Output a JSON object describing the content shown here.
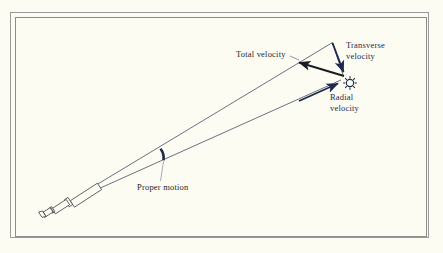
{
  "figure": {
    "background_color": "#fdfcf3",
    "frame_color": "#9a9a9a",
    "ink_color": "#1d2a4d",
    "dark_ink_color": "#23252b"
  },
  "labels": {
    "total_velocity": "Total velocity",
    "transverse_velocity_line1": "Transverse",
    "transverse_velocity_line2": "velocity",
    "radial_velocity_line1": "Radial",
    "radial_velocity_line2": "velocity",
    "proper_motion": "Proper motion"
  },
  "objects": {
    "telescope": "telescope-icon",
    "star": "star-icon",
    "angle_marker": "proper-motion-angle-arc"
  },
  "vectors": [
    {
      "name": "total-velocity",
      "label": "Total velocity",
      "style": "thick-arrow",
      "from": [
        343,
        75
      ],
      "to": [
        295,
        61
      ],
      "color": "#191c24"
    },
    {
      "name": "transverse-velocity",
      "label": "Transverse velocity",
      "style": "thick-arrow",
      "from": [
        332,
        42
      ],
      "to": [
        344,
        73
      ],
      "color": "#1d2a4d"
    },
    {
      "name": "radial-velocity",
      "label": "Radial velocity",
      "style": "thick-arrow",
      "from": [
        300,
        101
      ],
      "to": [
        340,
        83
      ],
      "color": "#1d2a4d"
    },
    {
      "name": "triangle-hypotenuse",
      "label": "",
      "style": "thin-line",
      "from": [
        332,
        42
      ],
      "to": [
        343,
        75
      ],
      "color": "#1d2a4d"
    }
  ],
  "sightlines": [
    {
      "name": "upper-sightline",
      "from": [
        96,
        185
      ],
      "to": [
        332,
        42
      ]
    },
    {
      "name": "lower-sightline",
      "from": [
        96,
        190
      ],
      "to": [
        342,
        80
      ]
    }
  ]
}
